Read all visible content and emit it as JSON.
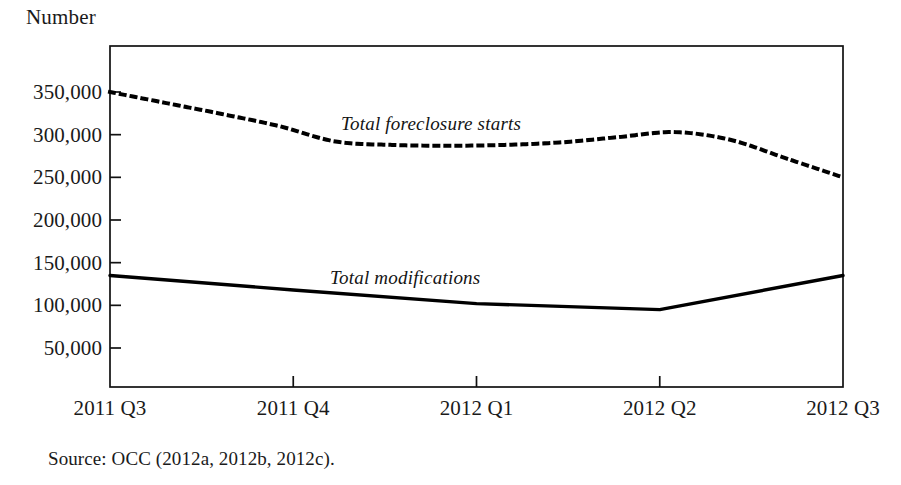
{
  "figure": {
    "axis_unit_label": "Number",
    "source_note": "Source: OCC (2012a, 2012b, 2012c)."
  },
  "annotations": {
    "foreclosure_label": "Total foreclosure starts",
    "modifications_label": "Total modifications"
  },
  "chart_data": {
    "type": "line",
    "title": "",
    "subtitle": "",
    "xlabel": "",
    "ylabel": "Number",
    "ylim": [
      0,
      375000
    ],
    "xlim": [
      "2011 Q3",
      "2012 Q3"
    ],
    "grid": false,
    "legend": "inline-annotations",
    "categories": [
      "2011 Q3",
      "2011 Q4",
      "2012 Q1",
      "2012 Q2",
      "2012 Q3"
    ],
    "ytick_labels": [
      "350,000",
      "300,000",
      "250,000",
      "200,000",
      "150,000",
      "100,000",
      "50,000"
    ],
    "ytick_values": [
      350000,
      300000,
      250000,
      200000,
      150000,
      100000,
      50000
    ],
    "xtick_labels": [
      "2011 Q3",
      "2011 Q4",
      "2012 Q1",
      "2012 Q2",
      "2012 Q3"
    ],
    "series": [
      {
        "name": "Total foreclosure starts",
        "style": "dotted",
        "color": "#000000",
        "values": [
          350000,
          292000,
          288000,
          303000,
          250000
        ],
        "detail_x": [
          "2011 Q3",
          "2011 Q3+",
          "2011 Q3++",
          "2011 Q4-",
          "2011 Q4",
          "2011 Q4+",
          "2012 Q1-",
          "2012 Q1",
          "2012 Q1+",
          "2012 Q2-",
          "2012 Q2",
          "2012 Q2+",
          "2012 Q3-",
          "2012 Q3"
        ],
        "detail_values": [
          350000,
          337000,
          324000,
          310000,
          292000,
          288000,
          287000,
          288000,
          291000,
          297000,
          303000,
          294000,
          272000,
          250000
        ]
      },
      {
        "name": "Total modifications",
        "style": "solid",
        "color": "#000000",
        "values": [
          135000,
          118000,
          102000,
          95000,
          135000
        ],
        "detail_x": [
          "2011 Q3",
          "2011 Q4",
          "2012 Q1",
          "2012 Q2",
          "2012 Q3"
        ],
        "detail_values": [
          135000,
          118000,
          102000,
          95000,
          135000
        ]
      }
    ]
  }
}
